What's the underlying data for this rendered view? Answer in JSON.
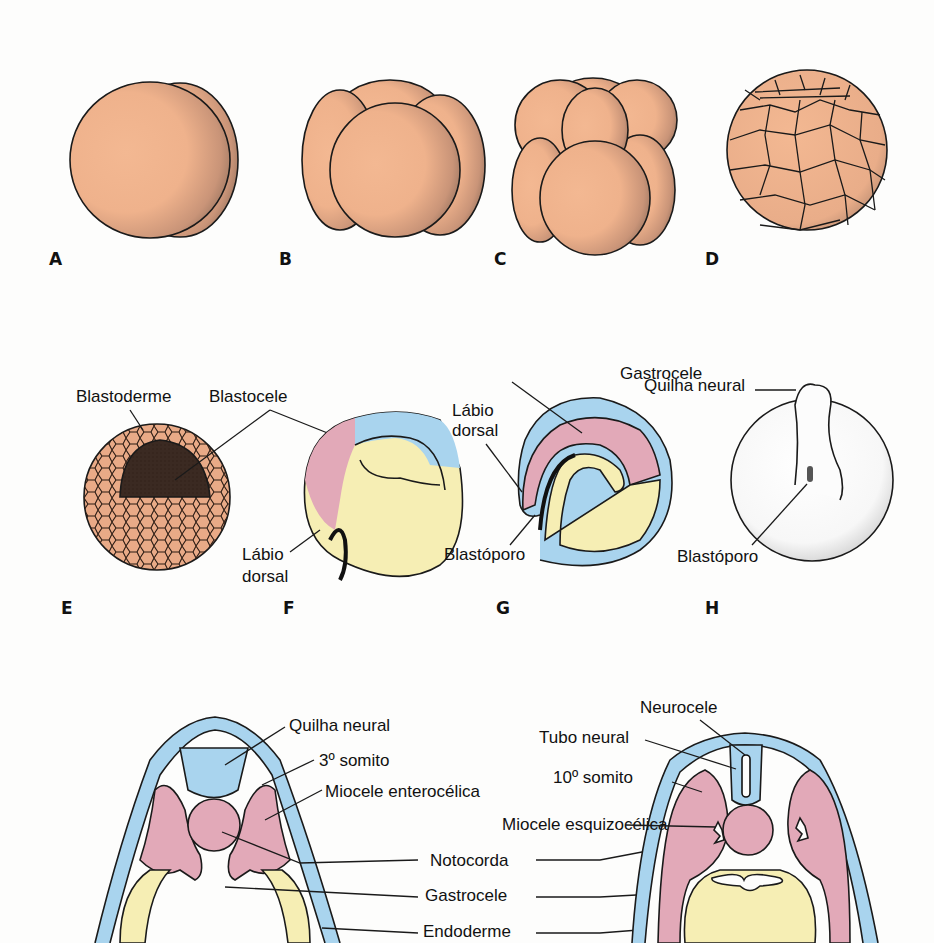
{
  "figure": {
    "panels": [
      {
        "id": "A",
        "label": "A"
      },
      {
        "id": "B",
        "label": "B"
      },
      {
        "id": "C",
        "label": "C"
      },
      {
        "id": "D",
        "label": "D"
      },
      {
        "id": "E",
        "label": "E",
        "annotations": [
          "Blastoderme",
          "Blastocele"
        ]
      },
      {
        "id": "F",
        "label": "F",
        "annotations": [
          "Lábio",
          "dorsal"
        ]
      },
      {
        "id": "G",
        "label": "G",
        "annotations": [
          "Gastrocele",
          "Lábio",
          "dorsal",
          "Blastóporo"
        ]
      },
      {
        "id": "H",
        "label": "H",
        "annotations": [
          "Quilha neural",
          "Blastóporo"
        ]
      }
    ],
    "section_left": {
      "annotations": [
        "Quilha neural",
        "3º somito",
        "Miocele enterocélica"
      ]
    },
    "section_right": {
      "annotations": [
        "Neurocele",
        "Tubo neural",
        "10º somito",
        "Miocele esquizocélica"
      ]
    },
    "shared_labels": [
      "Notocorda",
      "Gastrocele",
      "Endoderme"
    ],
    "colors": {
      "embryo_orange": "#f2b48f",
      "ectoderm_blue": "#a9d4ee",
      "mesoderm_pink": "#e2a9b8",
      "endoderm_yellow": "#f6eeb4",
      "outline": "#1a1a1a"
    }
  }
}
